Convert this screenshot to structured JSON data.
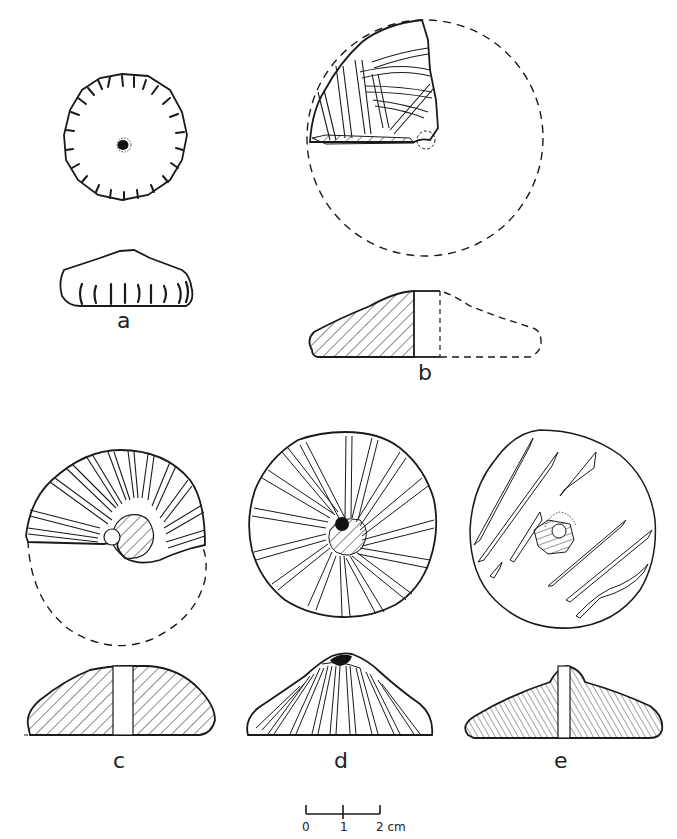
{
  "figure": {
    "type": "archaeological-illustration-plate",
    "background": "#ffffff",
    "ink_color": "#1a1a1a"
  },
  "objects": [
    {
      "id": "a",
      "label": "a",
      "views": [
        "plan",
        "section"
      ],
      "plan_shape": "complete disc with radial edge notches, central perforation",
      "completeness": "complete"
    },
    {
      "id": "b",
      "label": "b",
      "views": [
        "plan",
        "section"
      ],
      "plan_shape": "fragment (upper-left quadrant) with dashed reconstruction",
      "completeness": "fragment"
    },
    {
      "id": "c",
      "label": "c",
      "views": [
        "plan",
        "section"
      ],
      "plan_shape": "upper half with radial grooves, dashed lower reconstruction",
      "completeness": "half"
    },
    {
      "id": "d",
      "label": "d",
      "views": [
        "plan",
        "section"
      ],
      "plan_shape": "complete disc with swirling grooves, central perforation",
      "completeness": "complete"
    },
    {
      "id": "e",
      "label": "e",
      "views": [
        "plan",
        "section"
      ],
      "plan_shape": "complete disc with scattered diagonal grooves, off-centre perforation",
      "completeness": "complete"
    }
  ],
  "scale_bar": {
    "ticks": [
      "0",
      "1",
      "2"
    ],
    "unit": "cm",
    "label": "2 cm"
  }
}
